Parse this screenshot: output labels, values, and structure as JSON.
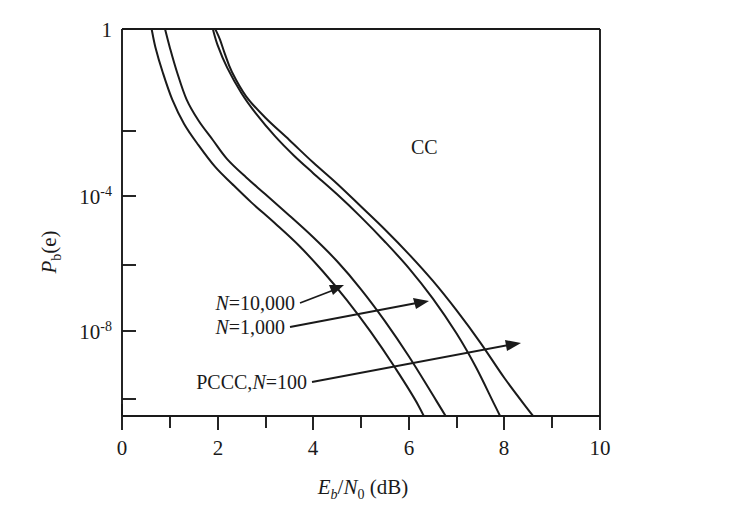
{
  "figure": {
    "background_color": "#ffffff",
    "ink_color": "#1a1a1a"
  },
  "chart_data": {
    "type": "line",
    "title": "",
    "subtitle": "",
    "xlabel": "Eb/N0 (dB)",
    "xlabel_parts": {
      "main1": "E",
      "sub1": "b",
      "slash": "/",
      "main2": "N",
      "sub2": "0",
      "unit": " (dB)"
    },
    "ylabel": "Pb(e)",
    "ylabel_parts": {
      "main": "P",
      "sub": "b",
      "arg": "(e)"
    },
    "xlim": [
      0,
      10
    ],
    "ylim": [
      1e-11,
      1
    ],
    "yscale": "log",
    "xscale": "linear",
    "grid": false,
    "legend": "none (inline annotations with leader arrows)",
    "xticks": [
      0,
      1,
      2,
      3,
      4,
      5,
      6,
      7,
      8,
      9,
      10
    ],
    "xtick_labels": [
      "0",
      "",
      "2",
      "",
      "4",
      "",
      "6",
      "",
      "8",
      "",
      "10"
    ],
    "yticks_labeled": [
      {
        "value": 1,
        "mantissa": "1",
        "exponent": ""
      },
      {
        "value": 0.0001,
        "mantissa": "10",
        "exponent": "-4"
      },
      {
        "value": 1e-08,
        "mantissa": "10",
        "exponent": "-8"
      }
    ],
    "yticks_minor": [
      0.01,
      1e-06,
      1e-10
    ],
    "series": [
      {
        "name": "CC",
        "label": "CC",
        "description": "Convolutional code bit error probability curve",
        "x": [
          1.95,
          2.05,
          2.15,
          2.3,
          2.6,
          3.0,
          3.5,
          4.0,
          4.5,
          5.0,
          5.5,
          6.0,
          6.5,
          7.0,
          7.5,
          8.0,
          8.5,
          9.0,
          9.3
        ],
        "y": [
          1.0,
          0.5,
          0.2,
          0.06,
          0.012,
          0.003,
          0.0007,
          0.00016,
          4e-05,
          9e-06,
          2e-06,
          4e-07,
          7e-08,
          1e-08,
          1.2e-09,
          1.2e-10,
          1.5e-11,
          2e-12,
          4e-13
        ]
      },
      {
        "name": "PCCC,N=100",
        "label": "PCCC,N=100",
        "label_parts": {
          "prefix": "PCCC,",
          "var": "N",
          "eq_value": "=100"
        },
        "description": "Parallel concatenated convolutional code, interleaver length 100",
        "x": [
          1.9,
          2.0,
          2.2,
          2.5,
          2.8,
          3.2,
          3.6,
          4.0,
          4.5,
          5.0,
          5.5,
          6.0,
          6.5,
          7.0,
          7.4,
          7.8,
          8.1
        ],
        "y": [
          1.0,
          0.35,
          0.08,
          0.015,
          0.004,
          0.0009,
          0.00025,
          8e-05,
          2e-05,
          4.5e-06,
          9e-07,
          1.6e-07,
          2.2e-08,
          2.2e-09,
          2.5e-10,
          2e-11,
          3e-12
        ]
      },
      {
        "name": "PCCC,N=1,000",
        "label": "N=1,000",
        "label_parts": {
          "var": "N",
          "eq_value": "=1,000"
        },
        "description": "Parallel concatenated convolutional code, interleaver length 1,000",
        "x": [
          0.9,
          1.0,
          1.15,
          1.35,
          1.6,
          1.9,
          2.2,
          2.6,
          3.0,
          3.5,
          4.0,
          4.5,
          5.0,
          5.5,
          6.0,
          6.5,
          7.0,
          7.35,
          7.6
        ],
        "y": [
          1.0,
          0.3,
          0.06,
          0.01,
          0.0025,
          0.0007,
          0.0002,
          6e-05,
          2e-05,
          5e-06,
          1.2e-06,
          2.5e-07,
          4e-08,
          5e-09,
          5e-10,
          4e-11,
          3e-12,
          4e-13,
          1e-13
        ]
      },
      {
        "name": "PCCC,N=10,000",
        "label": "N=10,000",
        "label_parts": {
          "var": "N",
          "eq_value": "=10,000"
        },
        "description": "Parallel concatenated convolutional code, interleaver length 10,000",
        "x": [
          0.62,
          0.7,
          0.85,
          1.05,
          1.3,
          1.6,
          1.95,
          2.3,
          2.7,
          3.2,
          3.7,
          4.2,
          4.7,
          5.2,
          5.7,
          6.2,
          6.6,
          6.9,
          7.05
        ],
        "y": [
          1.0,
          0.3,
          0.06,
          0.01,
          0.002,
          0.0005,
          0.00012,
          4e-05,
          1.2e-05,
          3e-06,
          7e-07,
          1.3e-07,
          2e-08,
          2.5e-09,
          2.5e-10,
          2e-11,
          1.5e-12,
          2e-13,
          5e-14
        ]
      }
    ],
    "annotations": [
      {
        "text": "CC",
        "kind": "inline-label",
        "x_data": 4.4,
        "y_data": 0.0011
      },
      {
        "text": "N=10,000",
        "kind": "leader-arrow-label",
        "x_data": 1.3,
        "y_data": 2.1e-07
      },
      {
        "text": "N=1,000",
        "kind": "leader-arrow-label",
        "x_data": 1.4,
        "y_data": 1.5e-08
      },
      {
        "text": "PCCC,N=100",
        "kind": "leader-arrow-label",
        "x_data": 0.8,
        "y_data": 2e-10
      }
    ]
  }
}
